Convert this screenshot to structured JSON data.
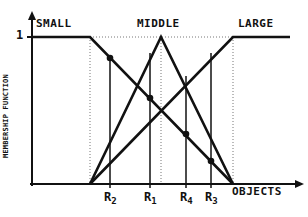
{
  "diagram": {
    "y_axis_label": "MEMBERSHIP FUNCTION",
    "x_axis_label": "OBJECTS",
    "y_tick_one": "1",
    "sets": [
      {
        "name": "SMALL",
        "label_x": 36
      },
      {
        "name": "MIDDLE",
        "label_x": 137
      },
      {
        "name": "LARGE",
        "label_x": 238
      }
    ],
    "r_markers": [
      {
        "letter": "R",
        "sub": "2",
        "x": 110
      },
      {
        "letter": "R",
        "sub": "1",
        "x": 150
      },
      {
        "letter": "R",
        "sub": "4",
        "x": 186
      },
      {
        "letter": "R",
        "sub": "3",
        "x": 211
      }
    ],
    "colors": {
      "line": "#111111",
      "dotted": "#777777",
      "background": "#ffffff"
    }
  }
}
